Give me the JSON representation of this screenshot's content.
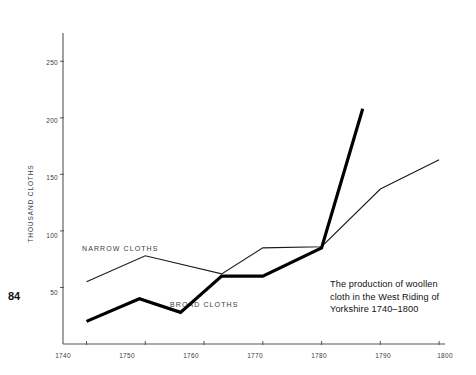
{
  "page_number": "84",
  "caption": {
    "line1": "The production of woollen",
    "line2": "cloth in the West Riding of",
    "line3": "Yorkshire 1740–1800"
  },
  "axes": {
    "y_title": "THOUSAND  CLOTHS",
    "y_ticks": [
      "50",
      "100",
      "150",
      "200",
      "250"
    ],
    "x_ticks": [
      "1740",
      "1750",
      "1760",
      "1770",
      "1780",
      "1790",
      "1800"
    ]
  },
  "series_labels": {
    "narrow": "NARROW  CLOTHS",
    "broad": "BROAD  CLOTHS"
  },
  "colors": {
    "ink": "#111111",
    "axis": "#555555",
    "tick_text": "#3c3c3c",
    "narrow_line": "#1a1a1a",
    "broad_line": "#000000"
  },
  "chart_data": {
    "type": "line",
    "title": "The production of woollen cloth in the West Riding of Yorkshire 1740–1800",
    "xlabel": "",
    "ylabel": "THOUSAND CLOTHS",
    "xlim": [
      1736,
      1801
    ],
    "ylim": [
      0,
      275
    ],
    "grid": false,
    "legend": "inline-labels",
    "x_ticks": [
      1740,
      1750,
      1760,
      1770,
      1780,
      1790,
      1800
    ],
    "y_ticks": [
      50,
      100,
      150,
      200,
      250
    ],
    "series": [
      {
        "name": "NARROW CLOTHS",
        "style": "thin",
        "points": [
          [
            1740,
            55
          ],
          [
            1750,
            78
          ],
          [
            1763,
            62
          ],
          [
            1770,
            85
          ],
          [
            1780,
            86
          ],
          [
            1790,
            137
          ],
          [
            1800,
            163
          ]
        ]
      },
      {
        "name": "BROAD CLOTHS",
        "style": "thick",
        "points": [
          [
            1740,
            20
          ],
          [
            1749,
            40
          ],
          [
            1756,
            28
          ],
          [
            1763,
            60
          ],
          [
            1770,
            60
          ],
          [
            1780,
            85
          ],
          [
            1787,
            208
          ]
        ]
      }
    ]
  }
}
